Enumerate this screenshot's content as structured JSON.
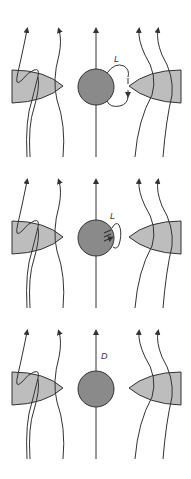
{
  "figure": {
    "colors": {
      "line": "#333333",
      "wedge_fill": "#bdbdbd",
      "sphere_fill": "#8a8a8a",
      "background": "#ffffff"
    },
    "panels": [
      {
        "id": "panel-1",
        "label": "L",
        "description": "flux loop L attached to central sphere, opening toward right wedge; left wedge shows field line loop"
      },
      {
        "id": "panel-2",
        "label": "L",
        "description": "small flux loop L on sphere surface with multiple small arrows"
      },
      {
        "id": "panel-3",
        "label": "D",
        "description": "straight field line D through sphere"
      }
    ]
  }
}
